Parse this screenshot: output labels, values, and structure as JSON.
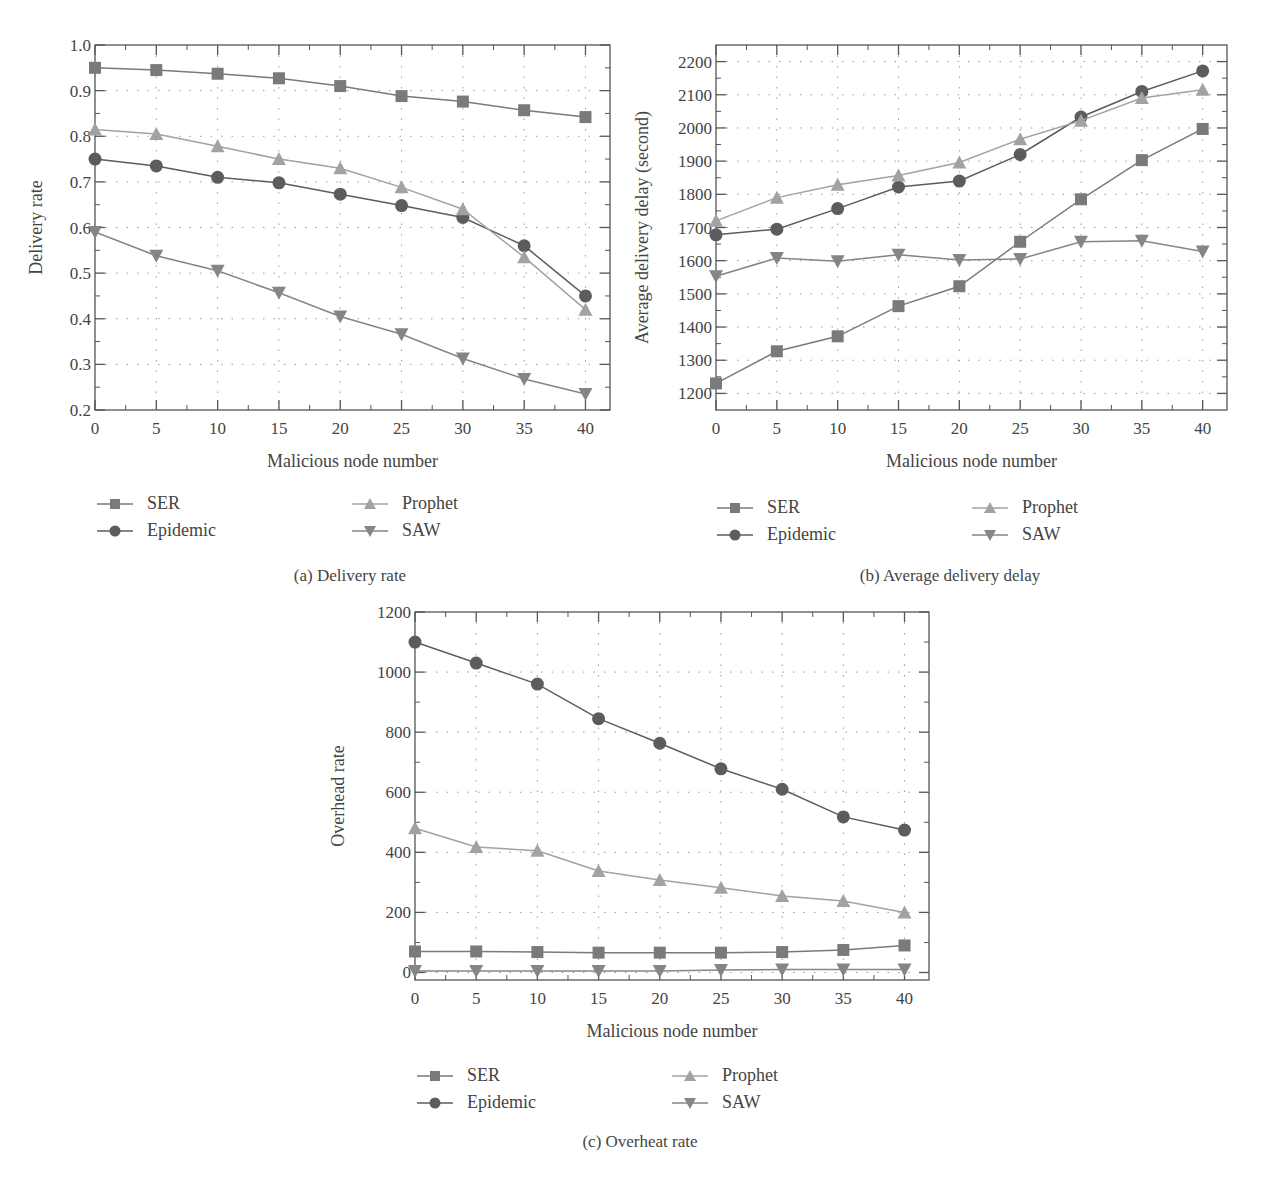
{
  "colors": {
    "SER": "#7a7a7a",
    "Epidemic": "#5c5c5c",
    "Prophet": "#a2a2a2",
    "SAW": "#858585",
    "axis": "#555555",
    "grid": "#9a9a9a"
  },
  "panels": [
    {
      "id": "a",
      "caption": "(a)  Delivery rate",
      "xlabel": "Malicious node number",
      "ylabel": "Delivery rate",
      "legend": [
        "SER",
        "Epidemic",
        "Prophet",
        "SAW"
      ]
    },
    {
      "id": "b",
      "caption": "(b)  Average delivery delay",
      "xlabel": "Malicious node number",
      "ylabel": "Average delivery delay (second)",
      "legend": [
        "SER",
        "Epidemic",
        "Prophet",
        "SAW"
      ]
    },
    {
      "id": "c",
      "caption": "(c)  Overheat rate",
      "xlabel": "Malicious node number",
      "ylabel": "Overhead rate",
      "legend": [
        "SER",
        "Epidemic",
        "Prophet",
        "SAW"
      ]
    }
  ],
  "chart_data": [
    {
      "type": "line",
      "title": "(a) Delivery rate",
      "xlabel": "Malicious node number",
      "ylabel": "Delivery rate",
      "x": [
        0,
        5,
        10,
        15,
        20,
        25,
        30,
        35,
        40
      ],
      "xticks": [
        "0",
        "5",
        "10",
        "15",
        "20",
        "25",
        "30",
        "35",
        "40"
      ],
      "yticks": [
        "0.2",
        "0.3",
        "0.4",
        "0.5",
        "0.6",
        "0.7",
        "0.8",
        "0.9",
        "1.0"
      ],
      "xlim": [
        0,
        42
      ],
      "ylim": [
        0.2,
        1.0
      ],
      "grid": true,
      "legend_position": "below",
      "series": [
        {
          "name": "SER",
          "marker": "square",
          "values": [
            0.95,
            0.945,
            0.937,
            0.927,
            0.91,
            0.888,
            0.876,
            0.857,
            0.842
          ]
        },
        {
          "name": "Epidemic",
          "marker": "circle",
          "values": [
            0.75,
            0.735,
            0.71,
            0.698,
            0.673,
            0.648,
            0.622,
            0.56,
            0.45
          ]
        },
        {
          "name": "Prophet",
          "marker": "triangle-up",
          "values": [
            0.815,
            0.805,
            0.778,
            0.75,
            0.73,
            0.688,
            0.64,
            0.535,
            0.42
          ]
        },
        {
          "name": "SAW",
          "marker": "triangle-down",
          "values": [
            0.59,
            0.538,
            0.505,
            0.457,
            0.405,
            0.366,
            0.313,
            0.268,
            0.235
          ]
        }
      ]
    },
    {
      "type": "line",
      "title": "(b) Average delivery delay",
      "xlabel": "Malicious node number",
      "ylabel": "Average delivery delay (second)",
      "x": [
        0,
        5,
        10,
        15,
        20,
        25,
        30,
        35,
        40
      ],
      "xticks": [
        "0",
        "5",
        "10",
        "15",
        "20",
        "25",
        "30",
        "35",
        "40"
      ],
      "yticks": [
        "1200",
        "1300",
        "1400",
        "1500",
        "1600",
        "1700",
        "1800",
        "1900",
        "2000",
        "2100",
        "2200"
      ],
      "xlim": [
        0,
        42
      ],
      "ylim": [
        1150,
        2250
      ],
      "grid": true,
      "legend_position": "below",
      "series": [
        {
          "name": "SER",
          "marker": "square",
          "values": [
            1230,
            1327,
            1372,
            1463,
            1523,
            1657,
            1785,
            1903,
            1997
          ]
        },
        {
          "name": "Epidemic",
          "marker": "circle",
          "values": [
            1678,
            1695,
            1757,
            1822,
            1840,
            1920,
            2033,
            2110,
            2172
          ]
        },
        {
          "name": "Prophet",
          "marker": "triangle-up",
          "values": [
            1720,
            1790,
            1829,
            1857,
            1896,
            1966,
            2022,
            2090,
            2115
          ]
        },
        {
          "name": "SAW",
          "marker": "triangle-down",
          "values": [
            1553,
            1608,
            1598,
            1618,
            1602,
            1605,
            1657,
            1660,
            1628
          ]
        }
      ]
    },
    {
      "type": "line",
      "title": "(c) Overheat rate",
      "xlabel": "Malicious node number",
      "ylabel": "Overhead rate",
      "x": [
        0,
        5,
        10,
        15,
        20,
        25,
        30,
        35,
        40
      ],
      "xticks": [
        "0",
        "5",
        "10",
        "15",
        "20",
        "25",
        "30",
        "35",
        "40"
      ],
      "yticks": [
        "0",
        "200",
        "400",
        "600",
        "800",
        "1000",
        "1200"
      ],
      "xlim": [
        0,
        42
      ],
      "ylim": [
        -25,
        1200
      ],
      "grid": true,
      "legend_position": "below",
      "series": [
        {
          "name": "SER",
          "marker": "square",
          "values": [
            70,
            70,
            68,
            66,
            66,
            66,
            68,
            75,
            90
          ]
        },
        {
          "name": "Epidemic",
          "marker": "circle",
          "values": [
            1100,
            1030,
            960,
            845,
            763,
            678,
            610,
            518,
            474
          ]
        },
        {
          "name": "Prophet",
          "marker": "triangle-up",
          "values": [
            480,
            418,
            405,
            338,
            308,
            282,
            255,
            238,
            200
          ]
        },
        {
          "name": "SAW",
          "marker": "triangle-down",
          "values": [
            5,
            5,
            5,
            5,
            5,
            8,
            10,
            10,
            10
          ]
        }
      ]
    }
  ]
}
